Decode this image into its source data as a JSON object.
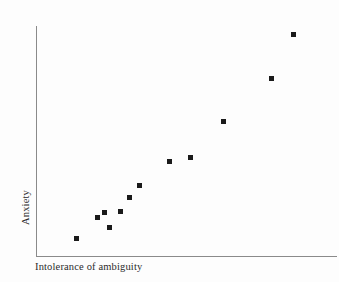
{
  "chart_data": {
    "type": "scatter",
    "title": "",
    "subtitle": "",
    "xlabel": "Intolerance of ambiguity",
    "ylabel": "Anxiety",
    "xticklabels": [],
    "yticklabels": [],
    "grid": false,
    "legend": null,
    "legend_position": "none",
    "xlim": [
      0,
      100
    ],
    "ylim": [
      0,
      100
    ],
    "marker": "square",
    "marker_color": "#1a1a1a",
    "marker_size_px": 5,
    "n_points": 13,
    "relationship": "strong positive linear",
    "points": [
      {
        "x": 13.3,
        "y": 7.8
      },
      {
        "x": 20.3,
        "y": 16.9
      },
      {
        "x": 22.6,
        "y": 19.0
      },
      {
        "x": 24.3,
        "y": 12.6
      },
      {
        "x": 27.9,
        "y": 25.5
      },
      {
        "x": 30.9,
        "y": 19.9
      },
      {
        "x": 34.2,
        "y": 30.7
      },
      {
        "x": 44.2,
        "y": 41.1
      },
      {
        "x": 51.2,
        "y": 42.4
      },
      {
        "x": 62.1,
        "y": 58.4
      },
      {
        "x": 78.1,
        "y": 77.1
      },
      {
        "x": 85.4,
        "y": 96.1
      }
    ],
    "pixel_points": [
      {
        "px": 76,
        "py": 238
      },
      {
        "px": 97,
        "py": 217
      },
      {
        "px": 104,
        "py": 212
      },
      {
        "px": 109,
        "py": 227
      },
      {
        "px": 120,
        "py": 211
      },
      {
        "px": 129,
        "py": 197
      },
      {
        "px": 139,
        "py": 185
      },
      {
        "px": 169,
        "py": 161
      },
      {
        "px": 190,
        "py": 157
      },
      {
        "px": 223,
        "py": 121
      },
      {
        "px": 271,
        "py": 78
      },
      {
        "px": 293,
        "py": 34
      }
    ],
    "axes": {
      "color": "#8a8a8a",
      "y_axis": {
        "x": 36,
        "y_top": 26,
        "y_bottom": 256
      },
      "x_axis": {
        "y": 256,
        "x_left": 36,
        "x_right": 337
      }
    },
    "background_color": "#fdfdfd"
  }
}
